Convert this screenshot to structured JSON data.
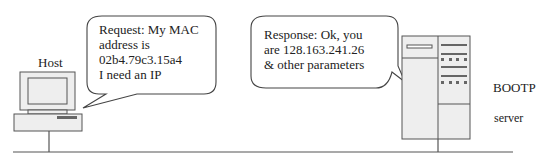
{
  "host": {
    "label": "Host"
  },
  "request_bubble": {
    "lines": [
      "Request: My MAC",
      "address is",
      "02b4.79c3.15a4",
      "I need an IP"
    ]
  },
  "response_bubble": {
    "lines": [
      "Response: Ok, you",
      "are 128.163.241.26",
      "& other parameters"
    ]
  },
  "server": {
    "label_line1": "BOOTP",
    "label_line2": "server"
  },
  "colors": {
    "stroke": "#444444",
    "device_fill": "#eeeeee",
    "background": "#ffffff"
  }
}
